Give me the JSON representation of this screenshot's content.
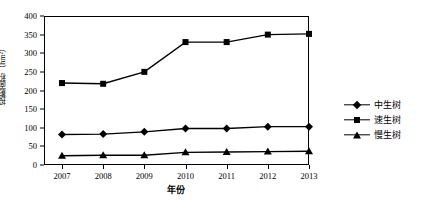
{
  "chart_data": {
    "type": "line",
    "title": "",
    "xlabel": "年份",
    "ylabel": "投影面积（hm²）",
    "categories": [
      "2007",
      "2008",
      "2009",
      "2010",
      "2011",
      "2012",
      "2013"
    ],
    "x": [
      2007,
      2008,
      2009,
      2010,
      2011,
      2012,
      2013
    ],
    "ylim": [
      0,
      400
    ],
    "yticks": [
      0,
      50,
      100,
      150,
      200,
      250,
      300,
      350,
      400
    ],
    "grid": false,
    "legend_position": "right",
    "series": [
      {
        "name": "中生树",
        "marker": "diamond",
        "color": "#000000",
        "values": [
          82,
          83,
          89,
          98,
          98,
          103,
          103
        ]
      },
      {
        "name": "速生树",
        "marker": "square",
        "color": "#000000",
        "values": [
          220,
          218,
          250,
          330,
          330,
          350,
          352
        ]
      },
      {
        "name": "慢生树",
        "marker": "triangle",
        "color": "#000000",
        "values": [
          25,
          26,
          26,
          34,
          35,
          36,
          37
        ]
      }
    ]
  },
  "axes": {
    "y_title": "投影面积（hm²）",
    "x_title": "年份",
    "y_tick_labels": [
      "400",
      "350",
      "300",
      "250",
      "200",
      "150",
      "100",
      "50",
      "0"
    ],
    "x_tick_labels": [
      "2007",
      "2008",
      "2009",
      "2010",
      "2011",
      "2012",
      "2013"
    ]
  },
  "legend": {
    "items": [
      {
        "label": "中生树",
        "marker": "diamond-marker"
      },
      {
        "label": "速生树",
        "marker": "square-marker"
      },
      {
        "label": "慢生树",
        "marker": "triangle-marker"
      }
    ]
  },
  "style": {
    "line_color": "#000000",
    "frame_color": "#000000",
    "background": "#ffffff"
  }
}
